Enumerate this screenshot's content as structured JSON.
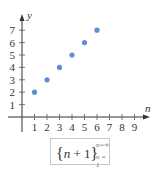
{
  "chart_data": {
    "type": "scatter",
    "title": "",
    "xlabel": "n",
    "ylabel": "y",
    "x": [
      1,
      2,
      3,
      4,
      5,
      6
    ],
    "y": [
      2,
      3,
      4,
      5,
      6,
      7
    ],
    "series": [
      {
        "name": "{n+1}",
        "x": [
          1,
          2,
          3,
          4,
          5,
          6
        ],
        "values": [
          2,
          3,
          4,
          5,
          6,
          7
        ]
      }
    ],
    "xticks": [
      1,
      2,
      3,
      4,
      5,
      6,
      7,
      8,
      9
    ],
    "yticks": [
      1,
      2,
      3,
      4,
      5,
      6,
      7
    ],
    "xlim": [
      0,
      9.5
    ],
    "ylim": [
      0,
      7.7
    ],
    "grid": false,
    "legend": "none",
    "annotation": "{n + 1} from n = 1 to n = ∞",
    "point_color": "#5b8fd4"
  },
  "axes": {
    "x_label": "n",
    "y_label": "y",
    "x_tick_labels": [
      "1",
      "2",
      "3",
      "4",
      "5",
      "6",
      "7",
      "8",
      "9"
    ],
    "y_tick_labels": [
      "1",
      "2",
      "3",
      "4",
      "5",
      "6",
      "7"
    ]
  },
  "formula": {
    "open_brace": "{",
    "variable": "n",
    "operator": " + 1",
    "close_brace": "}",
    "superscript": "n=∞",
    "subscript": "n = 1"
  }
}
